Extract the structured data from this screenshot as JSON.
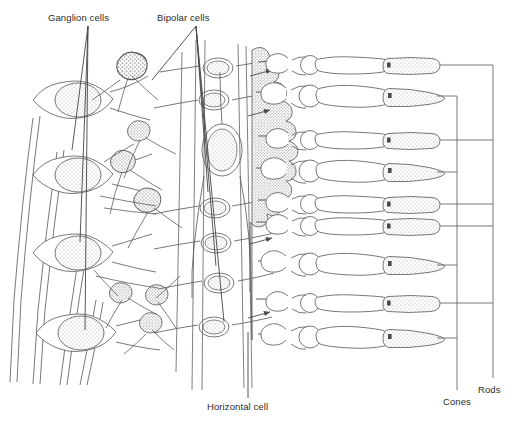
{
  "figure": {
    "kind": "retina-neural-circuit-diagram",
    "background_color": "#ffffff",
    "ink_color": "#555555",
    "stipple_color": "#8d8d8d",
    "text_color": "#2b2b2b"
  },
  "labels": {
    "ganglion_cells": "Ganglion cells",
    "bipolar_cells": "Bipolar cells",
    "horizontal_cell": "Horizontal cell",
    "cones": "Cones",
    "rods": "Rods"
  },
  "brackets": {
    "cones": {
      "x": 457,
      "label_x": 443,
      "label_y": 396,
      "leader_rows_y": [
        96,
        172,
        265,
        338
      ]
    },
    "rods": {
      "x": 493,
      "label_x": 478,
      "label_y": 384,
      "leader_rows_y": [
        65,
        140,
        204,
        226,
        303
      ]
    }
  },
  "photoreceptors": [
    {
      "index": 1,
      "type": "rod",
      "y": 65,
      "outer_segment": "cylindrical-blunt"
    },
    {
      "index": 2,
      "type": "cone",
      "y": 96,
      "outer_segment": "tapered-conical"
    },
    {
      "index": 3,
      "type": "rod",
      "y": 140,
      "outer_segment": "cylindrical-blunt"
    },
    {
      "index": 4,
      "type": "cone",
      "y": 172,
      "outer_segment": "tapered-conical"
    },
    {
      "index": 5,
      "type": "rod",
      "y": 204,
      "outer_segment": "cylindrical-blunt"
    },
    {
      "index": 6,
      "type": "rod",
      "y": 226,
      "outer_segment": "cylindrical-blunt"
    },
    {
      "index": 7,
      "type": "cone",
      "y": 265,
      "outer_segment": "tapered-conical"
    },
    {
      "index": 8,
      "type": "rod",
      "y": 303,
      "outer_segment": "cylindrical-blunt"
    },
    {
      "index": 9,
      "type": "cone",
      "y": 338,
      "outer_segment": "tapered-conical"
    }
  ],
  "ganglion_cells": [
    {
      "cx": 75,
      "cy": 100
    },
    {
      "cx": 75,
      "cy": 175
    },
    {
      "cx": 75,
      "cy": 253
    },
    {
      "cx": 78,
      "cy": 333
    }
  ],
  "bipolar_cells": [
    {
      "cx": 218,
      "cy": 68
    },
    {
      "cx": 214,
      "cy": 100
    },
    {
      "cx": 222,
      "cy": 150
    },
    {
      "cx": 215,
      "cy": 208
    },
    {
      "cx": 216,
      "cy": 243
    },
    {
      "cx": 219,
      "cy": 283
    },
    {
      "cx": 214,
      "cy": 327
    }
  ],
  "leaders": {
    "ganglion_cells": [
      {
        "x1": 88,
        "y1": 24,
        "x2": 72,
        "y2": 148
      },
      {
        "x1": 88,
        "y1": 24,
        "x2": 80,
        "y2": 240
      },
      {
        "x1": 88,
        "y1": 24,
        "x2": 84,
        "y2": 330
      }
    ],
    "bipolar_cells": [
      {
        "x1": 196,
        "y1": 24,
        "x2": 150,
        "y2": 78
      },
      {
        "x1": 196,
        "y1": 24,
        "x2": 206,
        "y2": 190
      },
      {
        "x1": 196,
        "y1": 24,
        "x2": 214,
        "y2": 265
      },
      {
        "x1": 196,
        "y1": 24,
        "x2": 222,
        "y2": 320
      }
    ],
    "horizontal_cell": {
      "x1": 248,
      "y1": 332,
      "x2": 248,
      "y2": 400
    }
  }
}
